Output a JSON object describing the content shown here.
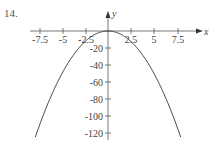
{
  "problem_number": "14.",
  "chart_data": {
    "type": "line",
    "title": "",
    "xlabel": "x",
    "ylabel": "y",
    "function": "y = -2x^2",
    "x_ticks": [
      "-7.5",
      "-5",
      "-2.5",
      "2.5",
      "5",
      "7.5"
    ],
    "y_ticks": [
      "-20",
      "-40",
      "-60",
      "-80",
      "-100",
      "-120"
    ],
    "xlim": [
      -10,
      10
    ],
    "ylim": [
      -125,
      15
    ],
    "grid": false,
    "series": [
      {
        "name": "parabola",
        "x": [
          -7.75,
          -5,
          -2.5,
          0,
          2.5,
          5,
          7.75
        ],
        "values": [
          -120,
          -50,
          -12.5,
          0,
          -12.5,
          -50,
          -120
        ]
      }
    ]
  }
}
